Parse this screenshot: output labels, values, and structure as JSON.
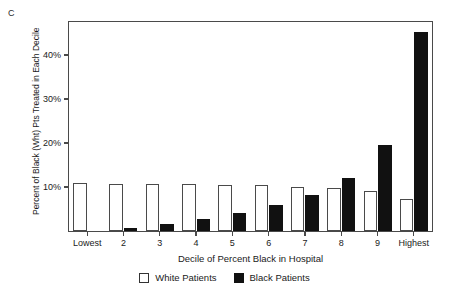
{
  "panel": {
    "letter": "C"
  },
  "chart_data": {
    "type": "bar",
    "title": "",
    "xlabel": "Decile of Percent Black in Hospital",
    "ylabel": "Percent of Black (Wht) Pts Treated in Each Decile",
    "categories": [
      "Lowest",
      "2",
      "3",
      "4",
      "5",
      "6",
      "7",
      "8",
      "9",
      "Highest"
    ],
    "series": [
      {
        "name": "White Patients",
        "color": "#ffffff",
        "edge_color": "#4a4a4a",
        "values": [
          10.8,
          10.7,
          10.7,
          10.6,
          10.5,
          10.4,
          10.0,
          9.8,
          9.2,
          7.3
        ]
      },
      {
        "name": "Black Patients",
        "color": "#111111",
        "edge_color": "#111111",
        "values": [
          0.0,
          0.7,
          1.7,
          2.8,
          4.1,
          6.0,
          8.2,
          12.0,
          19.5,
          45.3
        ]
      }
    ],
    "ylim": [
      0,
      47.5
    ],
    "yticks": [
      10,
      20,
      30,
      40
    ],
    "ytick_labels": [
      "10%",
      "20%",
      "30%",
      "40%"
    ],
    "grid": false,
    "legend_position": "bottom"
  },
  "legend": {
    "items": [
      {
        "label": "White Patients",
        "swatch": "white"
      },
      {
        "label": "Black Patients",
        "swatch": "black"
      }
    ]
  }
}
